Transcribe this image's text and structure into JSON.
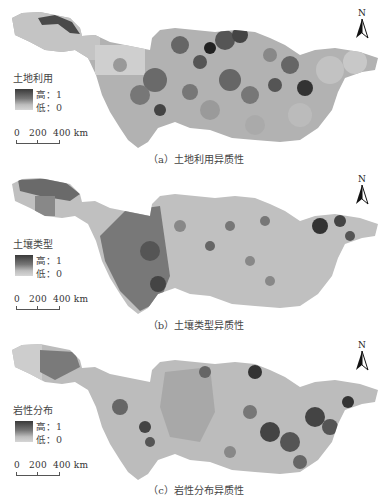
{
  "figure": {
    "panels": [
      {
        "id": "a",
        "caption": "（a）土地利用异质性",
        "legend": {
          "title": "土地利用",
          "high": "高：1",
          "low": "低：0"
        },
        "scale": {
          "labels": "0   200  400 km"
        },
        "north": "N",
        "pattern": "land-use",
        "colors": {
          "high": "#3a3a3a",
          "low": "#d6d6d6"
        }
      },
      {
        "id": "b",
        "caption": "（b）土壤类型异质性",
        "legend": {
          "title": "土壤类型",
          "high": "高：1",
          "low": "低：0"
        },
        "scale": {
          "labels": "0   200  400 km"
        },
        "north": "N",
        "pattern": "soil-type",
        "colors": {
          "high": "#3a3a3a",
          "low": "#d6d6d6"
        }
      },
      {
        "id": "c",
        "caption": "（c）岩性分布异质性",
        "legend": {
          "title": "岩性分布",
          "high": "高：1",
          "low": "低：0"
        },
        "scale": {
          "labels": "0   200  400 km"
        },
        "north": "N",
        "pattern": "lithology",
        "colors": {
          "high": "#3a3a3a",
          "low": "#d6d6d6"
        }
      }
    ]
  }
}
